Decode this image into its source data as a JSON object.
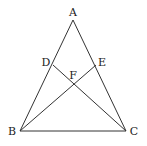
{
  "diagram": {
    "type": "geometry",
    "points": {
      "A": {
        "label": "A",
        "x": 73,
        "y": 20,
        "lx": 73,
        "ly": 13
      },
      "B": {
        "label": "B",
        "x": 20,
        "y": 131,
        "lx": 12,
        "ly": 132
      },
      "C": {
        "label": "C",
        "x": 126,
        "y": 131,
        "lx": 134,
        "ly": 132
      },
      "D": {
        "label": "D",
        "x": 53,
        "y": 65,
        "lx": 46,
        "ly": 63
      },
      "E": {
        "label": "E",
        "x": 96,
        "y": 65,
        "lx": 102,
        "ly": 63
      },
      "F": {
        "label": "F",
        "x": 73,
        "y": 84,
        "lx": 73,
        "ly": 76
      }
    },
    "segments": [
      [
        "A",
        "B"
      ],
      [
        "A",
        "C"
      ],
      [
        "B",
        "C"
      ],
      [
        "D",
        "C"
      ],
      [
        "E",
        "B"
      ]
    ]
  }
}
